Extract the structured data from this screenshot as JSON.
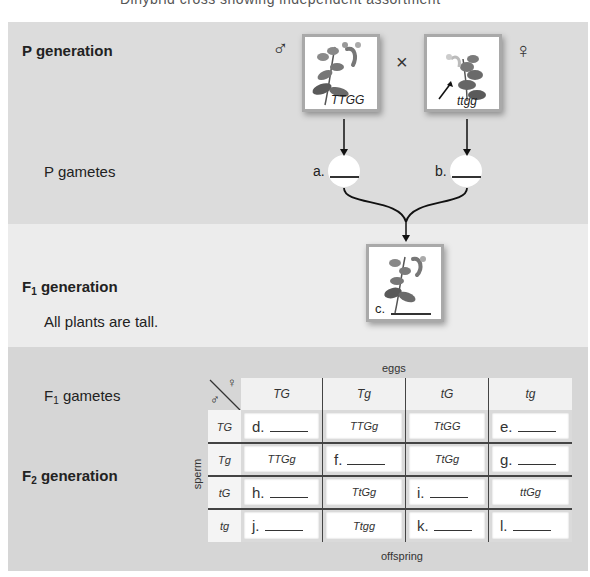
{
  "top_caption_fragment": "Dihybrid cross showing independent assortment",
  "p_generation": {
    "title": "P generation",
    "male_symbol": "♂",
    "female_symbol": "♀",
    "cross_symbol": "×",
    "male_genotype": "TTGG",
    "female_genotype": "ttgg"
  },
  "p_gametes": {
    "label": "P gametes",
    "a_label": "a.",
    "b_label": "b."
  },
  "f1_generation": {
    "title_main": "F",
    "title_sub": "1",
    "title_rest": " generation",
    "note": "All plants are tall.",
    "c_label": "c."
  },
  "f1_gametes": {
    "label_main": "F",
    "label_sub": "1",
    "label_rest": " gametes"
  },
  "f2_generation": {
    "title_main": "F",
    "title_sub": "2",
    "title_rest": " generation"
  },
  "punnett": {
    "top_label": "eggs",
    "side_label": "sperm",
    "bottom_label": "offspring",
    "corner_male": "♂",
    "corner_female": "♀",
    "columns": [
      "TG",
      "Tg",
      "tG",
      "tg"
    ],
    "rows": [
      {
        "header": "TG",
        "cells": [
          {
            "blank": true,
            "letter": "d."
          },
          {
            "blank": false,
            "text": "TTGg"
          },
          {
            "blank": false,
            "text": "TtGG"
          },
          {
            "blank": true,
            "letter": "e."
          }
        ]
      },
      {
        "header": "Tg",
        "cells": [
          {
            "blank": false,
            "text": "TTGg"
          },
          {
            "blank": true,
            "letter": "f."
          },
          {
            "blank": false,
            "text": "TtGg"
          },
          {
            "blank": true,
            "letter": "g."
          }
        ]
      },
      {
        "header": "tG",
        "cells": [
          {
            "blank": true,
            "letter": "h."
          },
          {
            "blank": false,
            "text": "TtGg"
          },
          {
            "blank": true,
            "letter": "i."
          },
          {
            "blank": false,
            "text": "ttGg"
          }
        ]
      },
      {
        "header": "tg",
        "cells": [
          {
            "blank": true,
            "letter": "j."
          },
          {
            "blank": false,
            "text": "Ttgg"
          },
          {
            "blank": true,
            "letter": "k."
          },
          {
            "blank": true,
            "letter": "l."
          }
        ]
      }
    ]
  }
}
